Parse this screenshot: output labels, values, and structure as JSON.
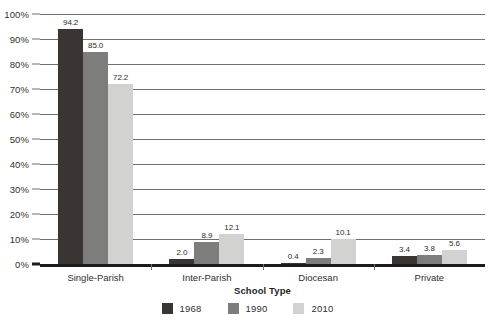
{
  "chart_data": {
    "type": "bar",
    "title": "",
    "xlabel": "School Type",
    "ylabel": "",
    "ylim": [
      0,
      100
    ],
    "ytick_labels": [
      "100%",
      "90%",
      "80%",
      "70%",
      "60%",
      "50%",
      "40%",
      "30%",
      "20%",
      "10%",
      "0%"
    ],
    "ytick_values": [
      100,
      90,
      80,
      70,
      60,
      50,
      40,
      30,
      20,
      10,
      0
    ],
    "grid": true,
    "legend_position": "bottom",
    "value_labels": true,
    "categories": [
      "Single-Parish",
      "Inter-Parish",
      "Diocesan",
      "Private"
    ],
    "series": [
      {
        "name": "1968",
        "color": "#3a3432",
        "values": [
          94.2,
          2.0,
          0.4,
          3.4
        ],
        "labels": [
          "94.2",
          "2.0",
          "0.4",
          "3.4"
        ]
      },
      {
        "name": "1990",
        "color": "#7d7d7b",
        "values": [
          85.0,
          8.9,
          2.3,
          3.8
        ],
        "labels": [
          "85.0",
          "8.9",
          "2.3",
          "3.8"
        ]
      },
      {
        "name": "2010",
        "color": "#d2d2d0",
        "values": [
          72.2,
          12.1,
          10.1,
          5.6
        ],
        "labels": [
          "72.2",
          "12.1",
          "10.1",
          "5.6"
        ]
      }
    ]
  }
}
